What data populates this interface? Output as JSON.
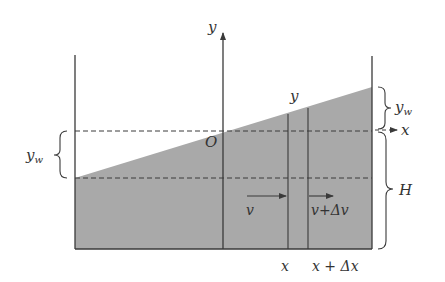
{
  "diagram": {
    "colors": {
      "water_fill": "#a9a9a9",
      "lines": "#3a3a3a",
      "text": "#333333",
      "background": "#ffffff"
    },
    "labels": {
      "y_axis": "y",
      "x_axis": "x",
      "origin": "O",
      "surface_height": "y",
      "yw_left_main": "y",
      "yw_left_sub": "w",
      "yw_right_main": "y",
      "yw_right_sub": "w",
      "depth": "H",
      "velocity_in": "v",
      "velocity_out": "v+Δv",
      "x_position": "x",
      "x_plus_dx": "x + Δx"
    }
  }
}
